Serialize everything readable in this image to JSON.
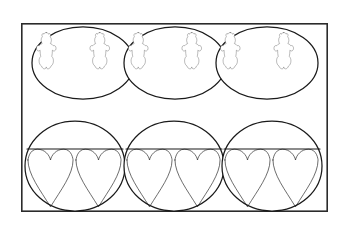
{
  "figure": {
    "title": "Cookie cutter shapes layout",
    "description": "Bordered rectangle containing six outlined cookie shapes arranged in two rows of three.",
    "background_color": "#ffffff",
    "line_color": "#1a1a1a",
    "frame_color": "#2b2b2b"
  },
  "frame": {
    "name": "outer-border",
    "x": 21,
    "y": 23,
    "width": 307,
    "height": 189,
    "stroke_width": 1.6
  },
  "rows": [
    {
      "name": "top-row",
      "shape_outline": "oval",
      "inner_shape": "teddy-bear",
      "inner_count": 2,
      "label": "Oval with two bears",
      "cells": [
        {
          "name": "oval-bears-1",
          "center_x": 83,
          "center_y": 63,
          "radius_x": 51,
          "radius_y": 36
        },
        {
          "name": "oval-bears-2",
          "center_x": 175,
          "center_y": 63,
          "radius_x": 51,
          "radius_y": 36
        },
        {
          "name": "oval-bears-3",
          "center_x": 267,
          "center_y": 63,
          "radius_x": 51,
          "radius_y": 36
        }
      ]
    },
    {
      "name": "bottom-row",
      "shape_outline": "circle",
      "inner_shape": "heart",
      "inner_count": 2,
      "label": "Circle with two hearts",
      "cells": [
        {
          "name": "circle-hearts-1",
          "center_x": 75,
          "center_y": 166,
          "radius_x": 50,
          "radius_y": 45,
          "chord_y": 149
        },
        {
          "name": "circle-hearts-2",
          "center_x": 174,
          "center_y": 166,
          "radius_x": 50,
          "radius_y": 45,
          "chord_y": 149
        },
        {
          "name": "circle-hearts-3",
          "center_x": 272,
          "center_y": 166,
          "radius_x": 50,
          "radius_y": 45,
          "chord_y": 149
        }
      ]
    }
  ]
}
